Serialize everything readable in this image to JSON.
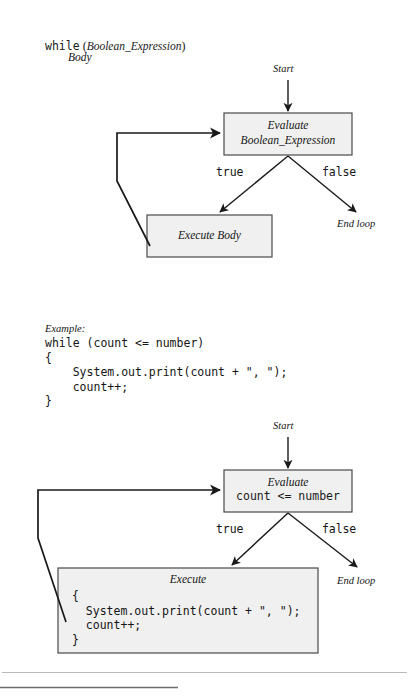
{
  "syntax": {
    "keyword": "while",
    "open_paren": " (",
    "expression": "Boolean_Expression",
    "close_paren": ")",
    "body": "Body"
  },
  "diagram_top": {
    "start_label": "Start",
    "evaluate_title": "Evaluate",
    "evaluate_expression": "Boolean_Expression",
    "true_label": "true",
    "false_label": "false",
    "execute_label": "Execute Body",
    "end_loop_label": "End loop"
  },
  "example": {
    "heading": "Example:",
    "code": "while (count <= number)\n{\n    System.out.print(count + \", \");\n    count++;\n}"
  },
  "diagram_bottom": {
    "start_label": "Start",
    "evaluate_title": "Evaluate",
    "evaluate_expression": "count <= number",
    "true_label": "true",
    "false_label": "false",
    "execute_title": "Execute",
    "execute_code": "{\n  System.out.print(count + \", \");\n  count++;\n}",
    "end_loop_label": "End loop"
  },
  "style": {
    "box_fill": "#f0f0f0",
    "box_border": "#4a4a4a",
    "line_color": "#1a1a1a",
    "rule_light": "#b9b9b9",
    "rule_dark": "#6d6d6d"
  }
}
